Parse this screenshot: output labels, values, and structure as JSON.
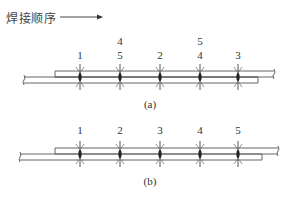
{
  "title": {
    "text": "焊接顺序",
    "arrow": "right-arrow"
  },
  "diagrams": [
    {
      "id": "a",
      "caption": "(a)",
      "weld_sequence_row1": [
        "1",
        "5",
        "2",
        "4",
        "3"
      ],
      "weld_sequence_row2": {
        "positions": [
          2,
          4
        ],
        "labels": [
          "4",
          "5"
        ]
      },
      "weld_count": 5
    },
    {
      "id": "b",
      "caption": "(b)",
      "weld_sequence_row1": [
        "1",
        "2",
        "3",
        "4",
        "5"
      ],
      "weld_count": 5
    }
  ],
  "colors": {
    "line": "#555555",
    "text": "#333333",
    "weld": "#222222"
  }
}
